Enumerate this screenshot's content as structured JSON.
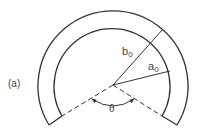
{
  "figure": {
    "panel_label": "(a)",
    "outer_radius_label": "b",
    "outer_radius_sub": "0",
    "inner_radius_label": "a",
    "inner_radius_sub": "0",
    "angle_label": "θ",
    "stroke_color": "#333333",
    "text_color": "#444444"
  }
}
